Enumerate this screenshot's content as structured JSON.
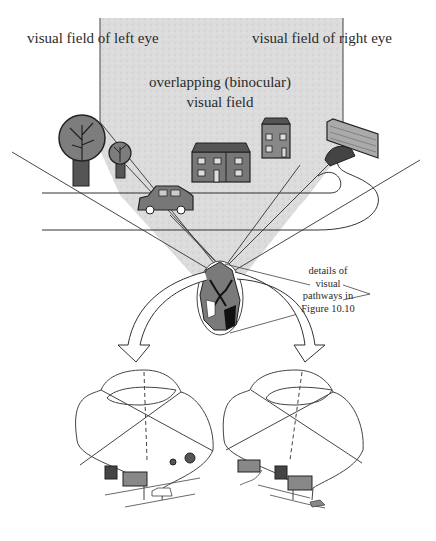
{
  "figure": {
    "labels": {
      "left_eye_field": "visual field of left eye",
      "right_eye_field": "visual field of right eye",
      "binocular_field": "overlapping (binocular) visual field",
      "details_note": "details of visual pathways in Figure 10.10"
    },
    "scene_objects": [
      "tree-large",
      "tree-small",
      "terraced-house",
      "tall-house",
      "brick-wall-with-car",
      "car",
      "road"
    ],
    "lower_panels": [
      {
        "name": "left-eye",
        "contents": [
          "house",
          "terraced-house",
          "tree-small",
          "tree-large",
          "car",
          "road"
        ]
      },
      {
        "name": "right-eye",
        "contents": [
          "wall-with-car",
          "house",
          "terraced-house",
          "road"
        ]
      }
    ],
    "colors": {
      "ink": "#2a2a2a",
      "field_shade": "#d9d9d9",
      "object_fill": "#7a7a7a",
      "background": "#ffffff"
    }
  }
}
